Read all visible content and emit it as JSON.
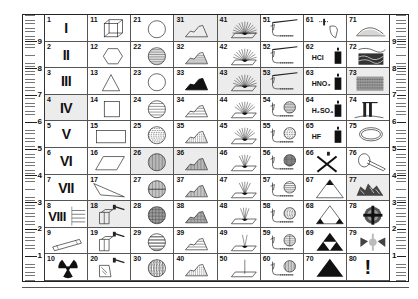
{
  "ruler": {
    "left_labels": [
      "9",
      "8",
      "7",
      "6",
      "5",
      "4",
      "3",
      "2",
      "1"
    ],
    "right_labels": [
      "9",
      "8",
      "7",
      "6",
      "5",
      "4",
      "3",
      "2",
      "1"
    ]
  },
  "cells": [
    {
      "n": "1",
      "roman": "I",
      "icon": "roman-numeral"
    },
    {
      "n": "2",
      "roman": "II",
      "icon": "roman-numeral"
    },
    {
      "n": "3",
      "roman": "III",
      "icon": "roman-numeral"
    },
    {
      "n": "4",
      "roman": "IV",
      "icon": "roman-numeral"
    },
    {
      "n": "5",
      "roman": "V",
      "icon": "roman-numeral"
    },
    {
      "n": "6",
      "roman": "VI",
      "icon": "roman-numeral"
    },
    {
      "n": "7",
      "roman": "VII",
      "icon": "roman-numeral"
    },
    {
      "n": "8",
      "roman": "VIII",
      "icon": "roman-numeral-with-lines"
    },
    {
      "n": "9",
      "icon": "cylinder-rod"
    },
    {
      "n": "10",
      "icon": "radiation-symbol"
    },
    {
      "n": "11",
      "icon": "wireframe-cube"
    },
    {
      "n": "12",
      "icon": "hexagon"
    },
    {
      "n": "13",
      "icon": "triangle"
    },
    {
      "n": "14",
      "icon": "square"
    },
    {
      "n": "15",
      "icon": "rectangle"
    },
    {
      "n": "16",
      "icon": "parallelogram"
    },
    {
      "n": "17",
      "icon": "scalene-triangle"
    },
    {
      "n": "18",
      "icon": "block-hammer"
    },
    {
      "n": "19",
      "icon": "block-hammer"
    },
    {
      "n": "20",
      "icon": "broken-block-hammer"
    },
    {
      "n": "21",
      "icon": "empty-circle"
    },
    {
      "n": "22",
      "icon": "circle-horizontal-lines"
    },
    {
      "n": "23",
      "icon": "filled-circle"
    },
    {
      "n": "24",
      "icon": "circle-wide-lines"
    },
    {
      "n": "25",
      "icon": "circle-dashed-lines"
    },
    {
      "n": "26",
      "icon": "circle-vertical-lines"
    },
    {
      "n": "27",
      "icon": "circle-vertical-lines-split"
    },
    {
      "n": "28",
      "icon": "circle-crosshatch"
    },
    {
      "n": "29",
      "icon": "circle-bands"
    },
    {
      "n": "30",
      "icon": "circle-speckled"
    },
    {
      "n": "31",
      "icon": "mountain-outline"
    },
    {
      "n": "32",
      "icon": "mountain-lines"
    },
    {
      "n": "33",
      "icon": "mountain-filled"
    },
    {
      "n": "34",
      "icon": "mountain-wide-lines"
    },
    {
      "n": "35",
      "icon": "mountain-dashed"
    },
    {
      "n": "36",
      "icon": "mountain-vertical-lines"
    },
    {
      "n": "37",
      "icon": "mountain-vertical-split"
    },
    {
      "n": "38",
      "icon": "mountain-crosshatch"
    },
    {
      "n": "39",
      "icon": "mountain-bands"
    },
    {
      "n": "40",
      "icon": "mountain-speckled"
    },
    {
      "n": "41",
      "icon": "fan-rays-dense"
    },
    {
      "n": "42",
      "icon": "fan-rays"
    },
    {
      "n": "43",
      "icon": "fan-rays"
    },
    {
      "n": "44",
      "icon": "fan-rays-sparse"
    },
    {
      "n": "45",
      "icon": "fan-rays-sparse"
    },
    {
      "n": "46",
      "icon": "rays-narrow"
    },
    {
      "n": "47",
      "icon": "rays-narrow"
    },
    {
      "n": "48",
      "icon": "rays-few"
    },
    {
      "n": "49",
      "icon": "rays-two"
    },
    {
      "n": "50",
      "icon": "single-ray"
    },
    {
      "n": "51",
      "icon": "burner-tube"
    },
    {
      "n": "52",
      "icon": "burner-tube"
    },
    {
      "n": "53",
      "icon": "burner-tube"
    },
    {
      "n": "54",
      "icon": "burner-circle-lines"
    },
    {
      "n": "55",
      "icon": "burner-circle-dashed"
    },
    {
      "n": "56",
      "icon": "burner-circle-crosshatch"
    },
    {
      "n": "57",
      "icon": "burner-circle-bands"
    },
    {
      "n": "58",
      "icon": "burner-circle-speckled"
    },
    {
      "n": "59",
      "icon": "burner-circle-split"
    },
    {
      "n": "60",
      "icon": "burner-circle-vertical"
    },
    {
      "n": "61",
      "icon": "dropper-stone"
    },
    {
      "n": "62",
      "chem": "HCl",
      "icon": "acid-bottle"
    },
    {
      "n": "63",
      "chem": "HNO₃",
      "icon": "acid-bottle"
    },
    {
      "n": "64",
      "chem": "H₂SO₄",
      "icon": "acid-bottle"
    },
    {
      "n": "65",
      "chem": "HF",
      "icon": "acid-bottle"
    },
    {
      "n": "66",
      "icon": "crossed-out-bottle"
    },
    {
      "n": "67",
      "icon": "triangle-top-filled"
    },
    {
      "n": "68",
      "icon": "triangle-corners-filled"
    },
    {
      "n": "69",
      "icon": "triforce"
    },
    {
      "n": "70",
      "icon": "filled-triangle"
    },
    {
      "n": "71",
      "icon": "dotted-mound"
    },
    {
      "n": "72",
      "icon": "wavy-layers"
    },
    {
      "n": "73",
      "icon": "layered-block"
    },
    {
      "n": "74",
      "icon": "pillars"
    },
    {
      "n": "75",
      "icon": "loop-ring"
    },
    {
      "n": "76",
      "icon": "loop-with-tail"
    },
    {
      "n": "77",
      "icon": "crumbled-pile"
    },
    {
      "n": "78",
      "icon": "target-cross"
    },
    {
      "n": "79",
      "icon": "fractured-cross"
    },
    {
      "n": "80",
      "chem": "!",
      "icon": "exclamation-mark"
    }
  ],
  "shaded": [
    "4",
    "18",
    "26",
    "31",
    "36",
    "41",
    "43",
    "53",
    "73",
    "77"
  ]
}
